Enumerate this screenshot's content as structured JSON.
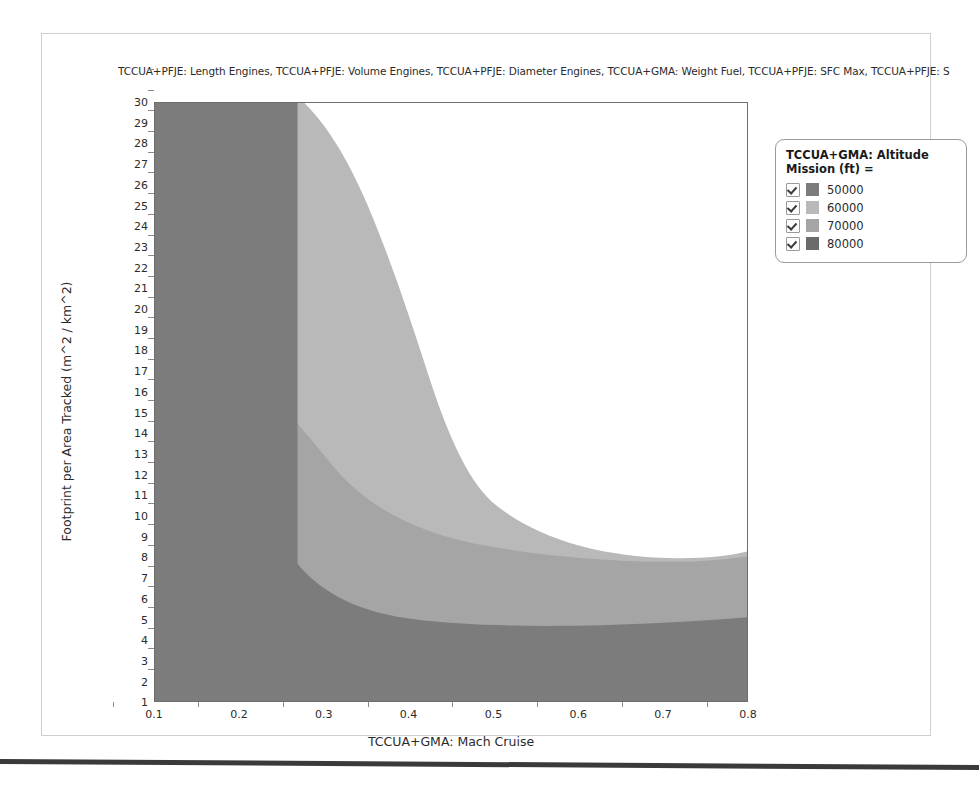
{
  "chart_title": "TCCUA+PFJE: Length Engines, TCCUA+PFJE: Volume Engines, TCCUA+PFJE: Diameter Engines, TCCUA+GMA: Weight Fuel, TCCUA+PFJE: SFC Max, TCCUA+PFJE: S",
  "legend": {
    "title": "TCCUA+GMA: Altitude Mission (ft) =",
    "entries": [
      {
        "label": "50000",
        "color": "#7c7c7c",
        "checked": true
      },
      {
        "label": "60000",
        "color": "#b9b9b9",
        "checked": true
      },
      {
        "label": "70000",
        "color": "#a5a5a5",
        "checked": true
      },
      {
        "label": "80000",
        "color": "#6b6b6b",
        "checked": true
      }
    ]
  },
  "chart_data": {
    "type": "heatmap",
    "title": "TCCUA+PFJE: Length Engines, TCCUA+PFJE: Volume Engines, TCCUA+PFJE: Diameter Engines, TCCUA+GMA: Weight Fuel, TCCUA+PFJE: SFC Max, TCCUA+PFJE: S",
    "xlabel": "TCCUA+GMA: Mach Cruise",
    "ylabel": "Footprint per Area Tracked (m^2 / km^2)",
    "xlim": [
      0.1,
      0.8
    ],
    "ylim": [
      1,
      30
    ],
    "grid": false,
    "legend_position": "right",
    "legend_title": "TCCUA+GMA: Altitude Mission (ft) =",
    "xticks": [
      "0.1",
      "0.2",
      "0.3",
      "0.4",
      "0.5",
      "0.6",
      "0.7",
      "0.8"
    ],
    "yticks": [
      "30",
      "29",
      "28",
      "27",
      "26",
      "25",
      "24",
      "23",
      "22",
      "21",
      "20",
      "19",
      "18",
      "17",
      "16",
      "15",
      "14",
      "13",
      "12",
      "11",
      "10",
      "9",
      "8",
      "7",
      "6",
      "5",
      "4",
      "3",
      "2",
      "1"
    ],
    "series": [
      {
        "name": "50000",
        "color": "#7c7c7c",
        "description": "Left vertical band from Mach 0.10 to about 0.20 spanning full footprint range, plus lower-left elbow region extending right along low footprint values (below about 7 at Mach 0.25 dropping to about 5.7 beyond Mach 0.45) and covering the entire bottom strip to Mach 0.80."
      },
      {
        "name": "60000",
        "color": "#b9b9b9",
        "description": "Upper mid band: starts near Mach 0.20 at footprint 30 and sweeps right-down; its upper boundary leaves the top of the plot near Mach 0.28 and descends to about footprint 18.5 around Mach 0.62, rising slightly to about 19 at Mach 0.80. Lower boundary near footprint 13-14 on the right."
      },
      {
        "name": "70000",
        "color": "#a5a5a5",
        "description": "Middle band between the 60000 band and the 50000 elbow: upper boundary about footprint 13-14 at the right edge, lower boundary about footprint 6-7 curving up sharply toward Mach 0.22 on the left."
      },
      {
        "name": "80000",
        "color": "#6b6b6b",
        "description": "Not visibly rendered as a distinct filled region; overlapped/obscured by the darker left and bottom fills."
      }
    ],
    "uncolored_region": "White (feasible gap) region occupies the upper-right: above the 60000 band boundary, roughly Mach > 0.28 and footprint above 19-30."
  },
  "axes": {
    "x": {
      "label": "TCCUA+GMA: Mach Cruise",
      "ticks": [
        "0.1",
        "0.2",
        "0.3",
        "0.4",
        "0.5",
        "0.6",
        "0.7",
        "0.8"
      ]
    },
    "y": {
      "label": "Footprint per Area Tracked (m^2 / km^2)",
      "ticks": [
        "30",
        "29",
        "28",
        "27",
        "26",
        "25",
        "24",
        "23",
        "22",
        "21",
        "20",
        "19",
        "18",
        "17",
        "16",
        "15",
        "14",
        "13",
        "12",
        "11",
        "10",
        "9",
        "8",
        "7",
        "6",
        "5",
        "4",
        "3",
        "2",
        "1"
      ]
    }
  }
}
